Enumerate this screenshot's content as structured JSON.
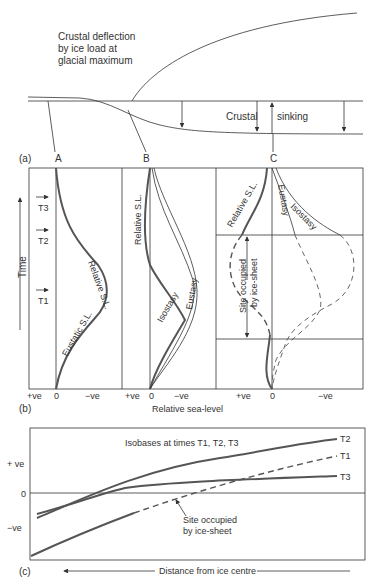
{
  "panel_a": {
    "tag": "(a)",
    "title_lines": [
      "Crustal deflection",
      "by ice load at",
      "glacial maximum"
    ],
    "label_left": "Crustal",
    "label_right": "sinking",
    "sites": [
      "A",
      "B",
      "C"
    ]
  },
  "panel_b": {
    "tag": "(b)",
    "y_axis_label": "Time",
    "times": [
      "T3",
      "T2",
      "T1"
    ],
    "x_axis_title": "Relative sea-level",
    "x_ticks": {
      "pos": "+ve",
      "zero": "0",
      "neg": "−ve"
    },
    "A": {
      "curves": [
        "Relative S.L.",
        "Eustatic S.L."
      ]
    },
    "B": {
      "curves": [
        "Relative S.L.",
        "Isostasy",
        "Eustasy"
      ]
    },
    "C": {
      "curves": [
        "Relative S.L.",
        "Eustasy",
        "Isostasy"
      ],
      "annotation": [
        "Site occupied",
        "by ice-sheet"
      ]
    }
  },
  "panel_c": {
    "tag": "(c)",
    "title": "Isobases at times T1, T2, T3",
    "y_ticks": [
      "+ ve",
      "0",
      "−ve"
    ],
    "series": [
      "T2",
      "T1",
      "T3"
    ],
    "annotation": [
      "Site occupied",
      "by ice-sheet"
    ],
    "x_axis_title": "Distance from ice centre"
  }
}
